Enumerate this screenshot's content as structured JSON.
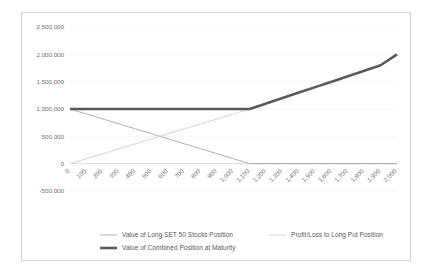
{
  "chart_data": {
    "type": "line",
    "title": "",
    "xlabel": "",
    "ylabel": "",
    "xlim": [
      0,
      2000
    ],
    "ylim": [
      -500000,
      2500000
    ],
    "grid": true,
    "legend_position": "bottom",
    "x": [
      0,
      100,
      200,
      300,
      400,
      500,
      600,
      700,
      800,
      900,
      1000,
      1100,
      1200,
      1300,
      1400,
      1500,
      1600,
      1700,
      1800,
      1900,
      2000
    ],
    "xtick_labels": [
      "0",
      "100",
      "200",
      "300",
      "400",
      "500",
      "600",
      "700",
      "800",
      "900",
      "1,000",
      "1,100",
      "1,200",
      "1,300",
      "1,400",
      "1,500",
      "1,600",
      "1,700",
      "1,800",
      "1,900",
      "2,000"
    ],
    "ytick_values": [
      -500000,
      0,
      500000,
      1000000,
      1500000,
      2000000,
      2500000
    ],
    "ytick_labels": [
      "-500,000",
      "0",
      "500,000",
      "1,000,000",
      "1,500,000",
      "2,000,000",
      "2,500,000"
    ],
    "series": [
      {
        "name": "Value of Long SET 50 Stocks Position",
        "color": "#a6a6a6",
        "width": 0.9,
        "values": [
          1000000,
          909091,
          818182,
          727273,
          636364,
          545455,
          454545,
          363636,
          272727,
          181818,
          90909,
          0,
          0,
          0,
          0,
          0,
          0,
          0,
          0,
          0,
          0
        ]
      },
      {
        "name": "Profit/Loss to Long Put Position",
        "color": "#cfcfcf",
        "width": 0.9,
        "values": [
          0,
          90909,
          181818,
          272727,
          363636,
          454545,
          545455,
          636364,
          727273,
          818182,
          909091,
          1000000,
          1100000,
          1200000,
          1300000,
          1400000,
          1500000,
          1600000,
          1700000,
          1800000,
          2000000
        ]
      },
      {
        "name": "Value of Combined Position at Maturity",
        "color": "#5a5a5a",
        "width": 2.6,
        "values": [
          1000000,
          1000000,
          1000000,
          1000000,
          1000000,
          1000000,
          1000000,
          1000000,
          1000000,
          1000000,
          1000000,
          1000000,
          1100000,
          1200000,
          1300000,
          1400000,
          1500000,
          1600000,
          1700000,
          1800000,
          2000000
        ]
      }
    ],
    "legend": [
      {
        "label": "Value of Long SET 50 Stocks Position",
        "color": "#a6a6a6",
        "width": 0.9
      },
      {
        "label": "Profit/Loss to Long Put Position",
        "color": "#cfcfcf",
        "width": 0.9
      },
      {
        "label": "Value of Combined Position at Maturity",
        "color": "#5a5a5a",
        "width": 2.6
      }
    ]
  },
  "style": {
    "frame_border_color": "#d4d4d4",
    "gridline_color": "#f2f2f2",
    "axis_color": "#d9d9d9",
    "tick_text_color": "#6f6f6f",
    "legend_text_color": "#5a5a5a",
    "background": "#ffffff"
  }
}
